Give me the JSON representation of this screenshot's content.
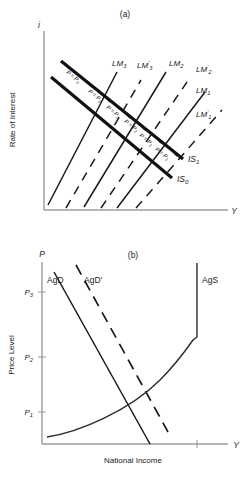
{
  "figure": {
    "panel_a": {
      "title": "(a)",
      "y_axis_label": "Rate of Interest",
      "y_axis_var": "i",
      "x_axis_var": "Y",
      "lm_curves": [
        {
          "name": "LM",
          "sub": "3",
          "prime": false,
          "label": "LM3"
        },
        {
          "name": "LM",
          "sub": "3",
          "prime": true,
          "label": "LM'3"
        },
        {
          "name": "LM",
          "sub": "2",
          "prime": false,
          "label": "LM2"
        },
        {
          "name": "LM",
          "sub": "2",
          "prime": true,
          "label": "LM'2"
        },
        {
          "name": "LM",
          "sub": "1",
          "prime": false,
          "label": "LM1"
        },
        {
          "name": "LM",
          "sub": "1",
          "prime": true,
          "label": "LM'1"
        }
      ],
      "is_curves": [
        {
          "name": "IS",
          "sub": "1",
          "label": "IS1"
        },
        {
          "name": "IS",
          "sub": "0",
          "label": "IS0"
        }
      ],
      "price_labels": [
        {
          "text": "P = P",
          "sub": "3"
        },
        {
          "text": "P = P",
          "sub": "3"
        },
        {
          "text": "P = P",
          "sub": "2"
        },
        {
          "text": "P = P",
          "sub": "2"
        },
        {
          "text": "P = P",
          "sub": "1"
        },
        {
          "text": "P = P",
          "sub": "1"
        }
      ]
    },
    "panel_b": {
      "title": "(b)",
      "y_axis_label": "Price Level",
      "y_axis_var": "P",
      "x_axis_label": "National Income",
      "x_axis_var": "Y",
      "y_ticks": [
        {
          "label": "P",
          "sub": "3"
        },
        {
          "label": "P",
          "sub": "2"
        },
        {
          "label": "P",
          "sub": "1"
        }
      ],
      "curves": [
        {
          "label": "AgD",
          "style": "solid"
        },
        {
          "label": "AgD'",
          "style": "dashed"
        },
        {
          "label": "AgS",
          "style": "solid"
        }
      ]
    },
    "colors": {
      "axis": "#9a9a9a",
      "curve": "#1a1a1a",
      "is_curve": "#111111",
      "background": "#ffffff"
    }
  }
}
